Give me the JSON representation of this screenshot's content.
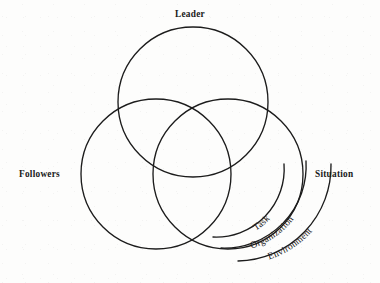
{
  "figure": {
    "type": "venn-diagram",
    "background_color": "#fdfdfc",
    "stroke_color": "#1c1c1c",
    "text_color": "#1a1a1a"
  },
  "circles": [
    {
      "id": "leader",
      "label": "Leader",
      "cx": 193,
      "cy": 102,
      "r": 75
    },
    {
      "id": "followers",
      "label": "Followers",
      "cx": 156,
      "cy": 174,
      "r": 75
    },
    {
      "id": "situation",
      "label": "Situation",
      "cx": 228,
      "cy": 174,
      "r": 75
    }
  ],
  "labels": {
    "leader": "Leader",
    "followers": "Followers",
    "situation": "Situation"
  },
  "bracket": {
    "title": "Situation components",
    "arcs": [
      {
        "id": "task",
        "label": "Task",
        "position": "inner"
      },
      {
        "id": "organization",
        "label": "Organization",
        "position": "middle"
      },
      {
        "id": "environment",
        "label": "Environment",
        "position": "outer"
      }
    ]
  }
}
